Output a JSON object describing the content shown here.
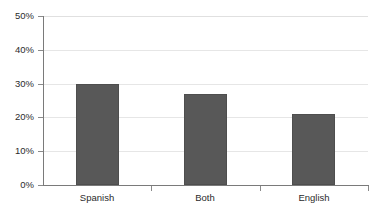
{
  "chart_data": {
    "type": "bar",
    "title": "",
    "subtitle": "",
    "xlabel": "",
    "ylabel": "",
    "categories": [
      "Spanish",
      "Both",
      "English"
    ],
    "values": [
      30,
      27,
      21
    ],
    "value_labels": [
      "30%",
      "27%",
      "21%"
    ],
    "series": [
      {
        "name": "Percent",
        "values": [
          30,
          27,
          21
        ]
      }
    ],
    "ylim": [
      0,
      50
    ],
    "ytick_values": [
      0,
      10,
      20,
      30,
      40,
      50
    ],
    "ytick_labels": [
      "0%",
      "10%",
      "20%",
      "30%",
      "40%",
      "50%"
    ],
    "grid": true,
    "grid_axis": "y",
    "legend": false,
    "legend_position": "none",
    "annotations": [],
    "colors": {
      "bar_fill": "#585858",
      "bar_stroke": "#4e4e4e",
      "gridline": "#e6e6e6",
      "axis": "#7a7a7a",
      "tick": "#8a8a8a",
      "text": "#2b2b2b",
      "background": "#ffffff"
    }
  },
  "axis": {
    "y": {
      "labels": [
        {
          "text": "50%",
          "value": 50
        },
        {
          "text": "40%",
          "value": 40
        },
        {
          "text": "30%",
          "value": 30
        },
        {
          "text": "20%",
          "value": 20
        },
        {
          "text": "10%",
          "value": 10
        },
        {
          "text": "0%",
          "value": 0
        }
      ]
    },
    "x": {
      "labels": [
        {
          "text": "Spanish"
        },
        {
          "text": "Both"
        },
        {
          "text": "English"
        }
      ]
    }
  }
}
